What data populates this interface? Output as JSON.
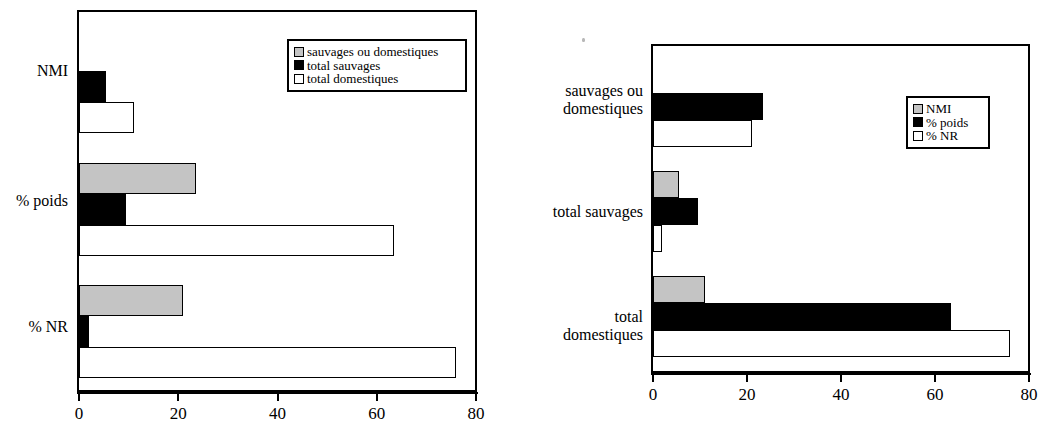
{
  "colors": {
    "gray": "#c4c4c4",
    "black": "#000000",
    "white": "#ffffff",
    "axis": "#000000"
  },
  "charts": [
    {
      "id": "left-chart",
      "type": "bar",
      "orientation": "horizontal",
      "title": "",
      "xlabel": "",
      "ylabel": "",
      "xlim": [
        0,
        80
      ],
      "xticks": [
        "0",
        "20",
        "40",
        "60",
        "80"
      ],
      "xtick_values": [
        0,
        20,
        40,
        60,
        80
      ],
      "grid": false,
      "legend_position": "top-right",
      "categories": [
        "NMI",
        "% poids",
        "% NR"
      ],
      "series": [
        {
          "name": "sauvages ou domestiques",
          "swatch": "gray",
          "values": [
            0,
            23.5,
            21
          ]
        },
        {
          "name": "total sauvages",
          "swatch": "black",
          "values": [
            5.5,
            9.5,
            2
          ]
        },
        {
          "name": "total domestiques",
          "swatch": "white",
          "values": [
            11,
            63.5,
            76
          ]
        }
      ]
    },
    {
      "id": "right-chart",
      "type": "bar",
      "orientation": "horizontal",
      "title": "",
      "xlabel": "",
      "ylabel": "",
      "xlim": [
        0,
        80
      ],
      "xticks": [
        "0",
        "20",
        "40",
        "60",
        "80"
      ],
      "xtick_values": [
        0,
        20,
        40,
        60,
        80
      ],
      "grid": false,
      "legend_position": "middle-right",
      "categories": [
        "sauvages ou\ndomestiques",
        "total sauvages",
        "total\ndomestiques"
      ],
      "series": [
        {
          "name": "NMI",
          "swatch": "gray",
          "values": [
            0,
            5.5,
            11
          ]
        },
        {
          "name": "% poids",
          "swatch": "black",
          "values": [
            23.5,
            9.5,
            63.5
          ]
        },
        {
          "name": "% NR",
          "swatch": "white",
          "values": [
            21,
            2,
            76
          ]
        }
      ]
    }
  ],
  "chart_data": [
    {
      "type": "bar",
      "orientation": "horizontal",
      "title": "",
      "xlabel": "",
      "ylabel": "",
      "categories": [
        "NMI",
        "% poids",
        "% NR"
      ],
      "series": [
        {
          "name": "sauvages ou domestiques",
          "values": [
            0,
            23.5,
            21
          ]
        },
        {
          "name": "total sauvages",
          "values": [
            5.5,
            9.5,
            2
          ]
        },
        {
          "name": "total domestiques",
          "values": [
            11,
            63.5,
            76
          ]
        }
      ],
      "xlim": [
        0,
        80
      ],
      "xticks": [
        0,
        20,
        40,
        60,
        80
      ],
      "grid": false,
      "legend": [
        "sauvages ou domestiques",
        "total sauvages",
        "total domestiques"
      ],
      "legend_position": "top-right"
    },
    {
      "type": "bar",
      "orientation": "horizontal",
      "title": "",
      "xlabel": "",
      "ylabel": "",
      "categories": [
        "sauvages ou domestiques",
        "total sauvages",
        "total domestiques"
      ],
      "series": [
        {
          "name": "NMI",
          "values": [
            0,
            5.5,
            11
          ]
        },
        {
          "name": "% poids",
          "values": [
            23.5,
            9.5,
            63.5
          ]
        },
        {
          "name": "% NR",
          "values": [
            21,
            2,
            76
          ]
        }
      ],
      "xlim": [
        0,
        80
      ],
      "xticks": [
        0,
        20,
        40,
        60,
        80
      ],
      "grid": false,
      "legend": [
        "NMI",
        "% poids",
        "% NR"
      ],
      "legend_position": "middle-right"
    }
  ]
}
